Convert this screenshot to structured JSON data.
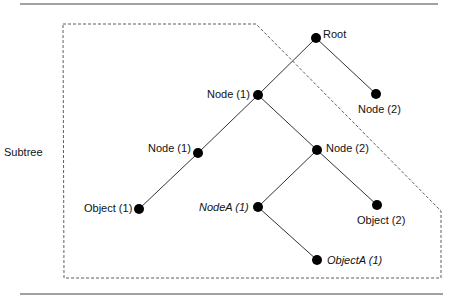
{
  "diagram": {
    "region_label": "Subtree",
    "nodes": [
      {
        "id": "root",
        "label": "Root",
        "italic": false
      },
      {
        "id": "node2-top",
        "label": "Node (2)",
        "italic": false
      },
      {
        "id": "node1-top",
        "label": "Node (1)",
        "italic": false
      },
      {
        "id": "node1-left",
        "label": "Node (1)",
        "italic": false
      },
      {
        "id": "node2-mid",
        "label": "Node (2)",
        "italic": false
      },
      {
        "id": "object1",
        "label": "Object (1)",
        "italic": false
      },
      {
        "id": "nodeA1",
        "label": "NodeA (1)",
        "italic": true
      },
      {
        "id": "object2",
        "label": "Object (2)",
        "italic": false
      },
      {
        "id": "objectA1",
        "label": "ObjectA (1)",
        "italic": true
      }
    ],
    "edges": [
      [
        "root",
        "node1-top"
      ],
      [
        "root",
        "node2-top"
      ],
      [
        "node1-top",
        "node1-left"
      ],
      [
        "node1-top",
        "node2-mid"
      ],
      [
        "node1-left",
        "object1"
      ],
      [
        "node2-mid",
        "nodeA1"
      ],
      [
        "node2-mid",
        "object2"
      ],
      [
        "nodeA1",
        "objectA1"
      ]
    ]
  }
}
